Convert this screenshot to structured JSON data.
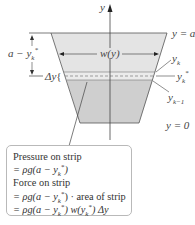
{
  "diagram": {
    "type": "trapezoidal-plate-hydrostatic-force",
    "colors": {
      "upper_region": "#e4e4e4",
      "lower_region": "#cfcfcf",
      "strip": "#e9e9e9",
      "outline": "#555555",
      "axis": "#444444",
      "callout_border": "#b9b9b9"
    },
    "axis_label": "y",
    "labels": {
      "top_level": "y = a",
      "bottom_level": "y = 0",
      "width": "w(y)",
      "depth": "a − y",
      "depth_sub": "k",
      "depth_sup": "*",
      "strip_height": "Δy",
      "yk": "y",
      "yk_sub": "k",
      "yk_star": "y",
      "yk_star_sub": "k",
      "yk_star_sup": "*",
      "yk_minus_1": "y",
      "yk_minus_1_sub": "k−1"
    },
    "callout": {
      "lines": [
        "Pressure on strip",
        "= ρg(a − y*k)",
        "Force on strip",
        "= ρg(a − y*k) · area of strip",
        "= ρg(a − y*k) w(y*k) Δy"
      ],
      "line1": "Pressure on strip",
      "line2_prefix": "= ρg(a − y",
      "line3": "Force on strip",
      "line4_prefix": "= ρg(a − y",
      "line4_suffix": ") · area of strip",
      "line5_prefix": "= ρg(a − y",
      "line5_mid": ") w(y",
      "line5_suffix": ") Δy",
      "sub": "k",
      "sup": "*"
    }
  }
}
